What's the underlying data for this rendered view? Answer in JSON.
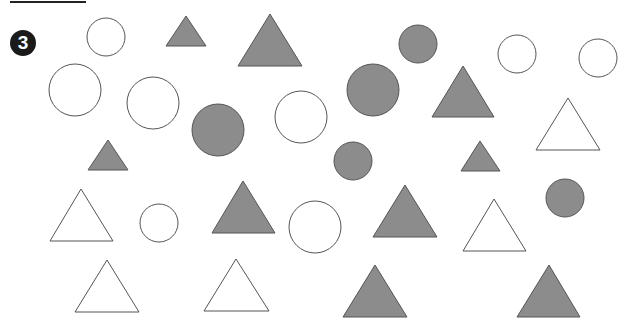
{
  "exercise": {
    "number": "3",
    "colors": {
      "filled": "#8c8c8c",
      "stroke": "#555555",
      "open": "#ffffff"
    }
  },
  "shapes": [
    {
      "type": "circle",
      "filled": false,
      "cx": 106,
      "cy": 37,
      "r": 19
    },
    {
      "type": "triangle",
      "filled": true,
      "apex": [
        186,
        16
      ],
      "base_y": 46,
      "x1": 166,
      "x2": 206
    },
    {
      "type": "triangle",
      "filled": true,
      "apex": [
        270,
        14
      ],
      "base_y": 66,
      "x1": 238,
      "x2": 302
    },
    {
      "type": "circle",
      "filled": true,
      "cx": 418,
      "cy": 44,
      "r": 19
    },
    {
      "type": "circle",
      "filled": false,
      "cx": 517,
      "cy": 54,
      "r": 19
    },
    {
      "type": "circle",
      "filled": false,
      "cx": 598,
      "cy": 58,
      "r": 19
    },
    {
      "type": "circle",
      "filled": false,
      "cx": 75,
      "cy": 90,
      "r": 26
    },
    {
      "type": "circle",
      "filled": false,
      "cx": 153,
      "cy": 103,
      "r": 26
    },
    {
      "type": "circle",
      "filled": true,
      "cx": 218,
      "cy": 130,
      "r": 26
    },
    {
      "type": "circle",
      "filled": false,
      "cx": 301,
      "cy": 117,
      "r": 26
    },
    {
      "type": "circle",
      "filled": true,
      "cx": 373,
      "cy": 90,
      "r": 26
    },
    {
      "type": "triangle",
      "filled": true,
      "apex": [
        463,
        66
      ],
      "base_y": 117,
      "x1": 432,
      "x2": 494
    },
    {
      "type": "triangle",
      "filled": false,
      "apex": [
        568,
        98
      ],
      "base_y": 150,
      "x1": 536,
      "x2": 600
    },
    {
      "type": "triangle",
      "filled": true,
      "apex": [
        108,
        140
      ],
      "base_y": 170,
      "x1": 88,
      "x2": 128
    },
    {
      "type": "circle",
      "filled": true,
      "cx": 353,
      "cy": 161,
      "r": 19
    },
    {
      "type": "triangle",
      "filled": true,
      "apex": [
        480,
        141
      ],
      "base_y": 171,
      "x1": 461,
      "x2": 500
    },
    {
      "type": "triangle",
      "filled": false,
      "apex": [
        81,
        189
      ],
      "base_y": 241,
      "x1": 50,
      "x2": 113
    },
    {
      "type": "circle",
      "filled": false,
      "cx": 159,
      "cy": 223,
      "r": 19
    },
    {
      "type": "triangle",
      "filled": true,
      "apex": [
        243,
        181
      ],
      "base_y": 233,
      "x1": 212,
      "x2": 275
    },
    {
      "type": "circle",
      "filled": false,
      "cx": 315,
      "cy": 227,
      "r": 26
    },
    {
      "type": "triangle",
      "filled": true,
      "apex": [
        405,
        185
      ],
      "base_y": 237,
      "x1": 373,
      "x2": 437
    },
    {
      "type": "triangle",
      "filled": false,
      "apex": [
        494,
        199
      ],
      "base_y": 251,
      "x1": 463,
      "x2": 526
    },
    {
      "type": "circle",
      "filled": true,
      "cx": 565,
      "cy": 198,
      "r": 19
    },
    {
      "type": "triangle",
      "filled": false,
      "apex": [
        107,
        260
      ],
      "base_y": 312,
      "x1": 75,
      "x2": 139
    },
    {
      "type": "triangle",
      "filled": false,
      "apex": [
        236,
        259
      ],
      "base_y": 311,
      "x1": 204,
      "x2": 269
    },
    {
      "type": "triangle",
      "filled": true,
      "apex": [
        375,
        265
      ],
      "base_y": 317,
      "x1": 343,
      "x2": 407
    },
    {
      "type": "triangle",
      "filled": true,
      "apex": [
        549,
        265
      ],
      "base_y": 317,
      "x1": 517,
      "x2": 580
    }
  ]
}
